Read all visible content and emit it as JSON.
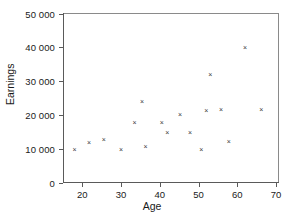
{
  "chart_data": {
    "type": "scatter",
    "title": "",
    "xlabel": "Age",
    "ylabel": "Earnings",
    "xlim": [
      15,
      70.5
    ],
    "ylim": [
      0,
      50000
    ],
    "grid": false,
    "legend": null,
    "marker": "x",
    "marker_color": "#3b3b3b",
    "xticks": [
      20,
      30,
      40,
      50,
      60,
      70
    ],
    "xtick_labels": [
      "20",
      "30",
      "40",
      "50",
      "60",
      "70"
    ],
    "yticks": [
      0,
      10000,
      20000,
      30000,
      40000,
      50000
    ],
    "ytick_labels": [
      "0",
      "10 000",
      "20 000",
      "30 000",
      "40 000",
      "50 000"
    ],
    "points": [
      {
        "x": 18,
        "y": 9700
      },
      {
        "x": 21.7,
        "y": 11700
      },
      {
        "x": 25.5,
        "y": 12500
      },
      {
        "x": 30,
        "y": 9500
      },
      {
        "x": 33.5,
        "y": 17700
      },
      {
        "x": 35.4,
        "y": 23800
      },
      {
        "x": 36.3,
        "y": 10600
      },
      {
        "x": 40.5,
        "y": 17700
      },
      {
        "x": 41.9,
        "y": 14700
      },
      {
        "x": 45.2,
        "y": 19900
      },
      {
        "x": 47.8,
        "y": 14700
      },
      {
        "x": 50.7,
        "y": 9700
      },
      {
        "x": 52,
        "y": 21100
      },
      {
        "x": 53,
        "y": 31700
      },
      {
        "x": 55.8,
        "y": 21500
      },
      {
        "x": 57.8,
        "y": 11900
      },
      {
        "x": 62,
        "y": 39700
      },
      {
        "x": 66.2,
        "y": 21500
      }
    ]
  }
}
